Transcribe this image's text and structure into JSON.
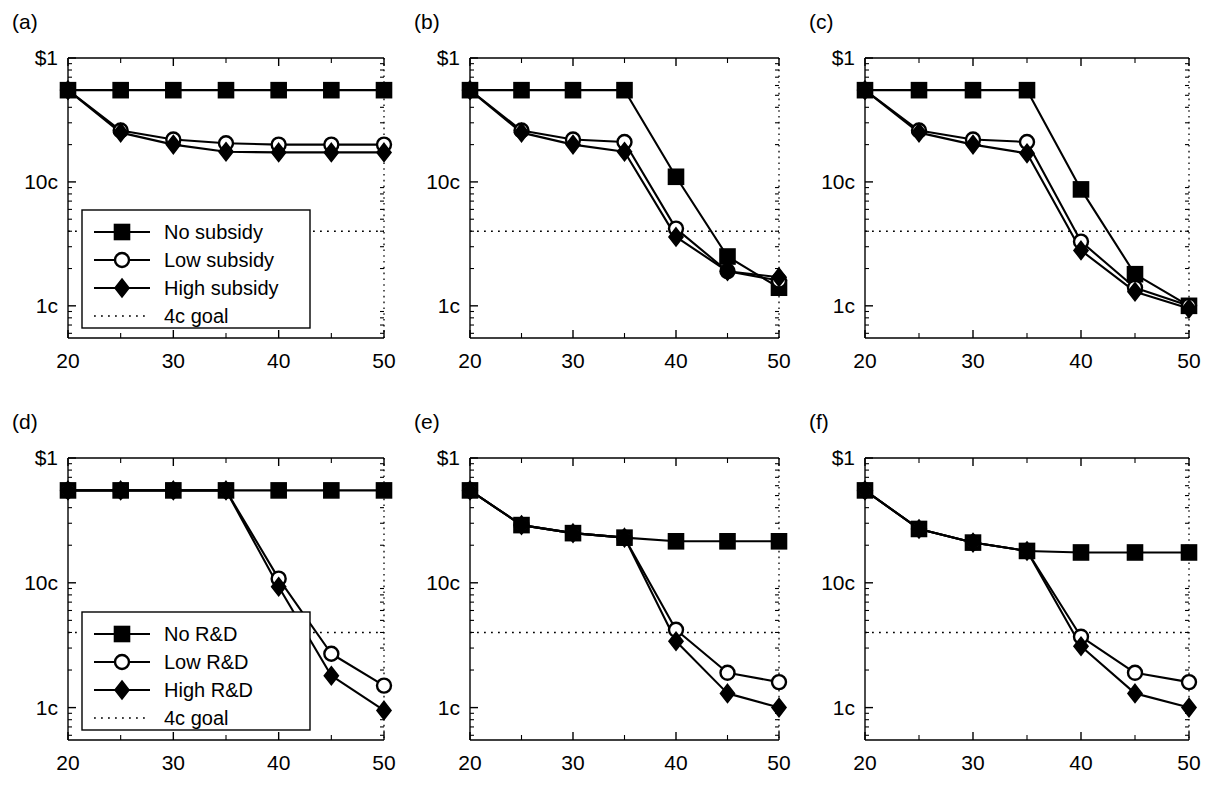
{
  "figure": {
    "background": "#ffffff",
    "ink": "#000000",
    "rows": 2,
    "cols": 3
  },
  "axis": {
    "x_label_ticks": [
      "20",
      "30",
      "40",
      "50"
    ],
    "x_label_values": [
      20,
      30,
      40,
      50
    ],
    "x_minor_values": [
      25,
      35,
      45
    ],
    "x_min": 20,
    "x_max": 50,
    "y_label_ticks": [
      "$1",
      "10c",
      "1c"
    ],
    "y_label_values": [
      100,
      10,
      1
    ],
    "y_min_cents": 0.55,
    "y_max_cents": 100,
    "y_scale": "log",
    "goal_value_cents": 4,
    "goal_label": "4c goal"
  },
  "legends": {
    "subsidy": {
      "panel": "a",
      "entries": [
        {
          "label": "No subsidy",
          "marker": "square-filled"
        },
        {
          "label": "Low subsidy",
          "marker": "circle-open"
        },
        {
          "label": "High subsidy",
          "marker": "diamond-filled"
        },
        {
          "label": "4c goal",
          "marker": "dotted-line"
        }
      ]
    },
    "rd": {
      "panel": "d",
      "entries": [
        {
          "label": "No R&D",
          "marker": "square-filled"
        },
        {
          "label": "Low R&D",
          "marker": "circle-open"
        },
        {
          "label": "High R&D",
          "marker": "diamond-filled"
        },
        {
          "label": "4c goal",
          "marker": "dotted-line"
        }
      ]
    }
  },
  "chart_data": [
    {
      "id": "a",
      "type": "line",
      "panel_label": "(a)",
      "title": "",
      "xlabel": "",
      "ylabel": "",
      "x": [
        20,
        25,
        30,
        35,
        40,
        45,
        50
      ],
      "xlim": [
        20,
        50
      ],
      "ylim": [
        0.55,
        100
      ],
      "yscale": "log",
      "grid": false,
      "legend_position": "lower-left",
      "legend_ref": "subsidy",
      "goal": 4,
      "series": [
        {
          "name": "No subsidy",
          "marker": "square-filled",
          "values": [
            55,
            55,
            55,
            55,
            55,
            55,
            55
          ]
        },
        {
          "name": "Low subsidy",
          "marker": "circle-open",
          "values": [
            55,
            26,
            22,
            20.5,
            20,
            20,
            20
          ]
        },
        {
          "name": "High subsidy",
          "marker": "diamond-filled",
          "values": [
            55,
            25,
            20,
            17.5,
            17.3,
            17.3,
            17.3
          ]
        }
      ]
    },
    {
      "id": "b",
      "type": "line",
      "panel_label": "(b)",
      "title": "",
      "xlabel": "",
      "ylabel": "",
      "x": [
        20,
        25,
        30,
        35,
        40,
        45,
        50
      ],
      "xlim": [
        20,
        50
      ],
      "ylim": [
        0.55,
        100
      ],
      "yscale": "log",
      "grid": false,
      "legend_position": "none",
      "goal": 4,
      "series": [
        {
          "name": "No subsidy",
          "marker": "square-filled",
          "values": [
            55,
            55,
            55,
            55,
            11,
            2.5,
            1.4
          ]
        },
        {
          "name": "Low subsidy",
          "marker": "circle-open",
          "values": [
            55,
            26,
            22,
            21,
            4.2,
            1.9,
            1.6
          ]
        },
        {
          "name": "High subsidy",
          "marker": "diamond-filled",
          "values": [
            55,
            25,
            20,
            17.5,
            3.6,
            1.9,
            1.7
          ]
        }
      ]
    },
    {
      "id": "c",
      "type": "line",
      "panel_label": "(c)",
      "title": "",
      "xlabel": "",
      "ylabel": "",
      "x": [
        20,
        25,
        30,
        35,
        40,
        45,
        50
      ],
      "xlim": [
        20,
        50
      ],
      "ylim": [
        0.55,
        100
      ],
      "yscale": "log",
      "grid": false,
      "legend_position": "none",
      "goal": 4,
      "series": [
        {
          "name": "No subsidy",
          "marker": "square-filled",
          "values": [
            55,
            55,
            55,
            55,
            8.7,
            1.8,
            1.0
          ]
        },
        {
          "name": "Low subsidy",
          "marker": "circle-open",
          "values": [
            55,
            26,
            22,
            21,
            3.3,
            1.4,
            1.0
          ]
        },
        {
          "name": "High subsidy",
          "marker": "diamond-filled",
          "values": [
            55,
            25,
            20,
            17,
            2.8,
            1.3,
            0.95
          ]
        }
      ]
    },
    {
      "id": "d",
      "type": "line",
      "panel_label": "(d)",
      "title": "",
      "xlabel": "",
      "ylabel": "",
      "x": [
        20,
        25,
        30,
        35,
        40,
        45,
        50
      ],
      "xlim": [
        20,
        50
      ],
      "ylim": [
        0.55,
        100
      ],
      "yscale": "log",
      "grid": false,
      "legend_position": "lower-left",
      "legend_ref": "rd",
      "goal": 4,
      "series": [
        {
          "name": "No R&D",
          "marker": "square-filled",
          "values": [
            55,
            55,
            55,
            55,
            55,
            55,
            55
          ]
        },
        {
          "name": "Low R&D",
          "marker": "circle-open",
          "values": [
            55,
            55,
            55,
            55,
            10.8,
            2.7,
            1.5
          ]
        },
        {
          "name": "High R&D",
          "marker": "diamond-filled",
          "values": [
            55,
            55,
            55,
            55,
            9.3,
            1.8,
            0.95
          ]
        }
      ]
    },
    {
      "id": "e",
      "type": "line",
      "panel_label": "(e)",
      "title": "",
      "xlabel": "",
      "ylabel": "",
      "x": [
        20,
        25,
        30,
        35,
        40,
        45,
        50
      ],
      "xlim": [
        20,
        50
      ],
      "ylim": [
        0.55,
        100
      ],
      "yscale": "log",
      "grid": false,
      "legend_position": "none",
      "goal": 4,
      "series": [
        {
          "name": "No R&D",
          "marker": "square-filled",
          "values": [
            55,
            29,
            25,
            23,
            21.5,
            21.5,
            21.5
          ]
        },
        {
          "name": "Low R&D",
          "marker": "circle-open",
          "values": [
            55,
            29,
            25,
            23,
            4.2,
            1.9,
            1.6
          ]
        },
        {
          "name": "High R&D",
          "marker": "diamond-filled",
          "values": [
            55,
            29,
            25,
            23,
            3.4,
            1.3,
            1.0
          ]
        }
      ]
    },
    {
      "id": "f",
      "type": "line",
      "panel_label": "(f)",
      "title": "",
      "xlabel": "",
      "ylabel": "",
      "x": [
        20,
        25,
        30,
        35,
        40,
        45,
        50
      ],
      "xlim": [
        20,
        50
      ],
      "ylim": [
        0.55,
        100
      ],
      "yscale": "log",
      "grid": false,
      "legend_position": "none",
      "goal": 4,
      "series": [
        {
          "name": "No R&D",
          "marker": "square-filled",
          "values": [
            55,
            27,
            21,
            18,
            17.5,
            17.5,
            17.5
          ]
        },
        {
          "name": "Low R&D",
          "marker": "circle-open",
          "values": [
            55,
            27,
            21,
            18,
            3.7,
            1.9,
            1.6
          ]
        },
        {
          "name": "High R&D",
          "marker": "diamond-filled",
          "values": [
            55,
            27,
            21,
            18,
            3.1,
            1.3,
            1.0
          ]
        }
      ]
    }
  ]
}
